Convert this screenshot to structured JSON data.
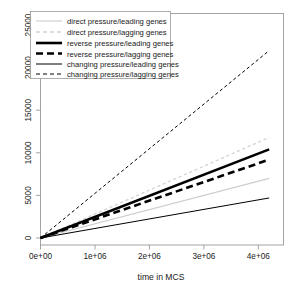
{
  "chart_data": {
    "type": "line",
    "title": "",
    "subtitle": "",
    "xlabel": "time in MCS",
    "ylabel": "",
    "xlim": [
      0,
      4200000
    ],
    "ylim": [
      0,
      26000
    ],
    "grid": false,
    "legend_position": "top-left",
    "xticks": [
      0,
      1000000,
      2000000,
      3000000,
      4000000
    ],
    "xticklabels": [
      "0e+00",
      "1e+06",
      "2e+06",
      "3e+06",
      "4e+06"
    ],
    "yticks": [
      0,
      5000,
      10000,
      15000,
      20000,
      25000
    ],
    "yticklabels": [
      "0",
      "5000",
      "10000",
      "15000",
      "20000",
      "25000"
    ],
    "x": [
      0,
      4200000
    ],
    "series": [
      {
        "name": "direct pressure/leading genes",
        "values": [
          0,
          7000
        ],
        "style": "solid",
        "width": 1.1,
        "color": "#cccccc"
      },
      {
        "name": "direct pressure/lagging genes",
        "values": [
          0,
          11800
        ],
        "style": "dashed",
        "width": 1.3,
        "color": "#d4d4d4"
      },
      {
        "name": "reverse pressure/leading genes",
        "values": [
          0,
          10400
        ],
        "style": "solid",
        "width": 2.6,
        "color": "#000000"
      },
      {
        "name": "reverse pressure/lagging genes",
        "values": [
          0,
          9200
        ],
        "style": "dashed",
        "width": 2.6,
        "color": "#000000"
      },
      {
        "name": "changing pressure/leading genes",
        "values": [
          0,
          4700
        ],
        "style": "solid",
        "width": 1.0,
        "color": "#000000"
      },
      {
        "name": "changing pressure/lagging genes",
        "values": [
          0,
          22000
        ],
        "style": "dashed",
        "width": 1.0,
        "color": "#000000"
      }
    ]
  },
  "legend": {
    "entries": [
      "direct pressure/leading genes",
      "direct pressure/lagging genes",
      "reverse pressure/leading genes",
      "reverse pressure/lagging genes",
      "changing pressure/leading genes",
      "changing pressure/lagging genes"
    ]
  }
}
